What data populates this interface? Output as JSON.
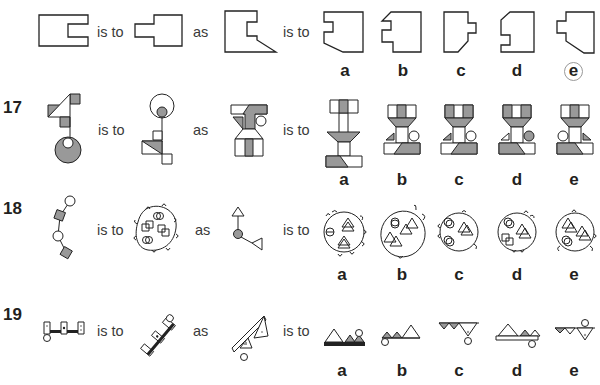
{
  "questions": [
    {
      "number": "",
      "connectors": [
        "is to",
        "as",
        "is to"
      ],
      "figures": [
        "notched-rectangle-left-opening",
        "rectangle-with-left-tab",
        "polygon-with-notch-and-slanted-corner"
      ],
      "options": [
        "a",
        "b",
        "c",
        "d",
        "e"
      ],
      "marked_answer": "e"
    },
    {
      "number": "17",
      "connectors": [
        "is to",
        "as",
        "is to"
      ],
      "figures": [
        "triangle-squares-on-stick-with-circle",
        "flipped-circle-on-stick-with-triangle",
        "hourglass-t-shape-with-circle"
      ],
      "options": [
        "a",
        "b",
        "c",
        "d",
        "e"
      ],
      "marked_answer": ""
    },
    {
      "number": "18",
      "connectors": [
        "is to",
        "as",
        "is to"
      ],
      "figures": [
        "chain-of-circles-and-squares",
        "blob-enclosing-paired-shapes",
        "circle-with-two-triangles"
      ],
      "options": [
        "a",
        "b",
        "c",
        "d",
        "e"
      ],
      "marked_answer": ""
    },
    {
      "number": "19",
      "connectors": [
        "is to",
        "as",
        "is to"
      ],
      "figures": [
        "horizontal-bar-with-squares-and-circle",
        "rotated-bar-with-squares-and-circle",
        "slanted-bar-with-triangles-and-circle"
      ],
      "options": [
        "a",
        "b",
        "c",
        "d",
        "e"
      ],
      "marked_answer": ""
    }
  ]
}
